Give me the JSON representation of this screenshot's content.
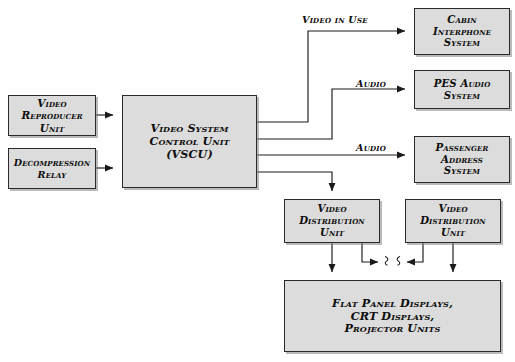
{
  "diagram": {
    "colors": {
      "box_fill": "#dcdcdc",
      "box_border": "#2a2a2a",
      "line": "#1a1a1a",
      "background": "#ffffff",
      "shadow": "#828282"
    },
    "nodes": [
      {
        "id": "video-reproducer-unit",
        "label": "Video\nReproducer\nUnit"
      },
      {
        "id": "decompression-relay",
        "label": "Decompression\nRelay"
      },
      {
        "id": "video-system-control-unit",
        "label": "Video System\nControl Unit\n(VSCU)"
      },
      {
        "id": "cabin-interphone-system",
        "label": "Cabin\nInterphone\nSystem"
      },
      {
        "id": "pes-audio-system",
        "label": "PES Audio\nSystem"
      },
      {
        "id": "passenger-address-system",
        "label": "Passenger\nAddress\nSystem"
      },
      {
        "id": "video-distribution-unit-1",
        "label": "Video\nDistribution\nUnit"
      },
      {
        "id": "video-distribution-unit-2",
        "label": "Video\nDistribution\nUnit"
      },
      {
        "id": "display-units",
        "label": "Flat Panel Displays,\nCRT Displays,\nProjector Units"
      }
    ],
    "edge_labels": {
      "video_in_use": "Video in Use",
      "audio_upper": "Audio",
      "audio_lower": "Audio"
    },
    "connections": [
      {
        "from": "video-reproducer-unit",
        "to": "video-system-control-unit",
        "label": ""
      },
      {
        "from": "decompression-relay",
        "to": "video-system-control-unit",
        "label": ""
      },
      {
        "from": "video-system-control-unit",
        "to": "cabin-interphone-system",
        "label": "Video in Use"
      },
      {
        "from": "video-system-control-unit",
        "to": "pes-audio-system",
        "label": "Audio"
      },
      {
        "from": "video-system-control-unit",
        "to": "passenger-address-system",
        "label": "Audio"
      },
      {
        "from": "video-system-control-unit",
        "to": "video-distribution-unit-1",
        "label": ""
      },
      {
        "from": "video-distribution-unit-1",
        "to": "display-units",
        "label": ""
      },
      {
        "from": "video-distribution-unit-2",
        "to": "display-units",
        "label": ""
      },
      {
        "from": "video-distribution-unit-1",
        "to": "break-right",
        "label": ""
      },
      {
        "from": "break-left",
        "to": "video-distribution-unit-2",
        "label": ""
      }
    ]
  }
}
